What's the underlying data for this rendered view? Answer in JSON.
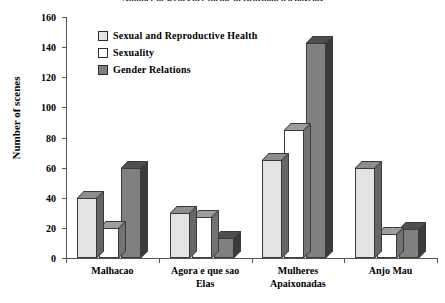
{
  "chart_data": {
    "type": "bar",
    "title": "Number of scenes per theme in Brazilian telenovelas",
    "xlabel": "",
    "ylabel": "Number of scenes",
    "ylim": [
      0,
      160
    ],
    "ytick_step": 20,
    "ytick_labels": [
      "0",
      "20",
      "40",
      "60",
      "80",
      "100",
      "120",
      "140",
      "160"
    ],
    "grid": false,
    "legend_position": "upper-left-inside",
    "categories": [
      "Malhacao",
      "Agora e que sao\nElas",
      "Mulheres\nApaixonadas",
      "Anjo Mau"
    ],
    "series": [
      {
        "name": "Sexual and Reproductive Health",
        "color": "#e3e3e3",
        "values": [
          40,
          30,
          65,
          60
        ]
      },
      {
        "name": "Sexuality",
        "color": "#ffffff",
        "values": [
          20,
          27,
          85,
          16
        ]
      },
      {
        "name": "Gender Relations",
        "color": "#808080",
        "values": [
          60,
          13,
          143,
          19
        ]
      }
    ]
  },
  "axis": {
    "line_color": "#555555"
  }
}
